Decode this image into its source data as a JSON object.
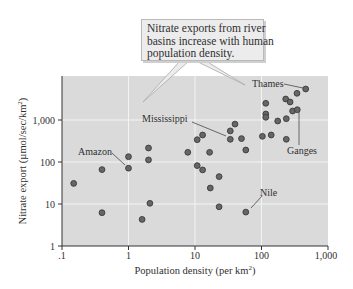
{
  "callout": {
    "lines": [
      "Nitrate exports from river",
      "basins increase with human",
      "population density."
    ]
  },
  "axes": {
    "xlabel": "Population density (per km",
    "xlabel_sup": "2",
    "xlabel_end": ")",
    "ylabel": "Nitrate export (µmol/sec/km",
    "ylabel_sup": "2",
    "ylabel_end": ")",
    "xticks": [
      ".1",
      "1",
      "10",
      "100",
      "1,000"
    ],
    "yticks": [
      "1",
      "10",
      "100",
      "1,000"
    ]
  },
  "annotations": {
    "amazon": "Amazon",
    "mississippi": "Mississippi",
    "thames": "Thames",
    "ganges": "Ganges",
    "nile": "Nile"
  },
  "colors": {
    "plot_bg": "#dadada",
    "grid": "#f4f4f4",
    "point_fill": "#666666",
    "point_stroke": "#3a3a3a"
  },
  "chart_data": {
    "type": "scatter",
    "title": "Nitrate exports from river basins increase with human population density.",
    "xlabel": "Population density (per km^2)",
    "ylabel": "Nitrate export (µmol/sec/km^2)",
    "xscale": "log",
    "yscale": "log",
    "xlim": [
      0.1,
      1000
    ],
    "ylim": [
      1,
      6000
    ],
    "xticks": [
      0.1,
      1,
      10,
      100,
      1000
    ],
    "yticks": [
      1,
      10,
      100,
      1000
    ],
    "grid": true,
    "legend": null,
    "points": [
      {
        "x": 0.15,
        "y": 31
      },
      {
        "x": 0.4,
        "y": 66
      },
      {
        "x": 0.4,
        "y": 6.2
      },
      {
        "x": 1.0,
        "y": 134
      },
      {
        "x": 1.0,
        "y": 71,
        "label": "Amazon"
      },
      {
        "x": 2.0,
        "y": 215
      },
      {
        "x": 2.0,
        "y": 112
      },
      {
        "x": 2.1,
        "y": 10.4
      },
      {
        "x": 1.6,
        "y": 4.3
      },
      {
        "x": 40,
        "y": 800
      },
      {
        "x": 34,
        "y": 550
      },
      {
        "x": 13,
        "y": 440
      },
      {
        "x": 10.8,
        "y": 340
      },
      {
        "x": 34,
        "y": 347,
        "label": "Mississippi"
      },
      {
        "x": 50,
        "y": 360
      },
      {
        "x": 58,
        "y": 193
      },
      {
        "x": 7.8,
        "y": 170
      },
      {
        "x": 16.6,
        "y": 170
      },
      {
        "x": 10.8,
        "y": 82
      },
      {
        "x": 13,
        "y": 65
      },
      {
        "x": 23,
        "y": 45
      },
      {
        "x": 17,
        "y": 24
      },
      {
        "x": 23,
        "y": 8.6
      },
      {
        "x": 58,
        "y": 6.4,
        "label": "Nile"
      },
      {
        "x": 103,
        "y": 410
      },
      {
        "x": 140,
        "y": 440
      },
      {
        "x": 236,
        "y": 347
      },
      {
        "x": 175,
        "y": 946
      },
      {
        "x": 236,
        "y": 1074
      },
      {
        "x": 294,
        "y": 1640
      },
      {
        "x": 345,
        "y": 1760,
        "label": "Ganges"
      },
      {
        "x": 116,
        "y": 2500
      },
      {
        "x": 116,
        "y": 1390
      },
      {
        "x": 116,
        "y": 1160
      },
      {
        "x": 231,
        "y": 3160
      },
      {
        "x": 269,
        "y": 2680
      },
      {
        "x": 342,
        "y": 4330
      },
      {
        "x": 462,
        "y": 5470,
        "label": "Thames"
      }
    ]
  }
}
